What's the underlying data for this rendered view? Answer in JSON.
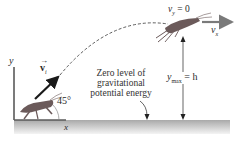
{
  "diagram": {
    "type": "projectile-motion",
    "labels": {
      "y_axis": "y",
      "x_axis": "x",
      "initial_velocity": "v",
      "initial_velocity_sub": "i",
      "angle": "45°",
      "vy_top": "v",
      "vy_top_sub": "y",
      "vy_top_eq": "= 0",
      "vx_top": "v",
      "vx_top_sub": "x",
      "zero_level_line1": "Zero level of",
      "zero_level_line2": "gravitational",
      "zero_level_line3": "potential energy",
      "ymax": "y",
      "ymax_sub": "max",
      "ymax_eq": "= h"
    },
    "colors": {
      "ground": "#b8b8b8",
      "ground_shadow": "#e0e0e0",
      "axis": "#555555",
      "arrow_dark": "#1a1a1a",
      "arrow_gray": "#7a7a7a",
      "grasshopper": "#6b5a5a",
      "trajectory": "#333333"
    }
  }
}
